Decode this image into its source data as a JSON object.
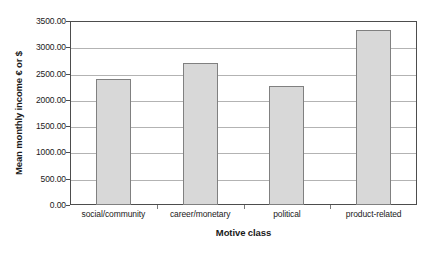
{
  "chart_data": {
    "type": "bar",
    "title": "",
    "xlabel": "Motive class",
    "ylabel": "Mean monthly income € or $",
    "categories": [
      "social/community",
      "career/monetary",
      "political",
      "product-related"
    ],
    "values": [
      2390.0,
      2700.0,
      2270.0,
      3330.0
    ],
    "series": [
      {
        "name": "Mean monthly income",
        "values": [
          2390.0,
          2700.0,
          2270.0,
          3330.0
        ]
      }
    ],
    "ylim": [
      0,
      3500
    ],
    "ytick_values": [
      0,
      500,
      1000,
      1500,
      2000,
      2500,
      3000,
      3500
    ],
    "ytick_labels": [
      "0.00",
      "500.00",
      "1000.00",
      "1500.00",
      "2000.00",
      "2500.00",
      "3000.00",
      "3500.00"
    ],
    "grid": "horizontal",
    "legend": "none",
    "bar_fill_color": "#d8d8d8",
    "bar_border_color": "#808080",
    "gridline_color": "#b3b3b3",
    "axis_color": "#4d4d4d",
    "background_color": "#ffffff"
  }
}
